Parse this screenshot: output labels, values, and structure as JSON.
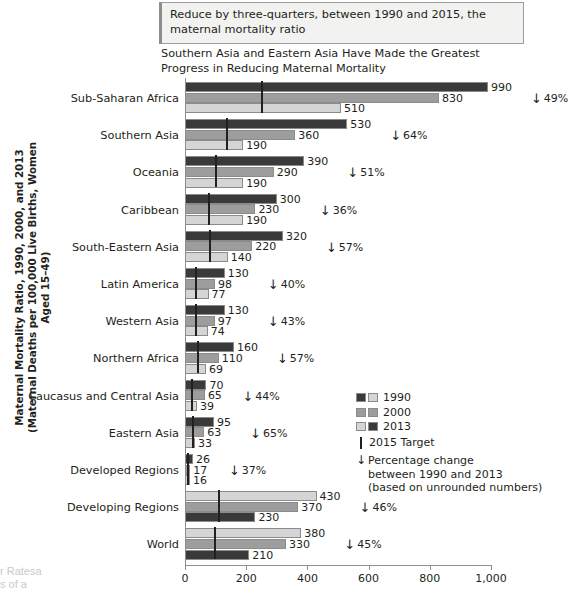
{
  "goal_box": {
    "text": "Reduce by three-quarters, between 1990 and 2015, the maternal mortality ratio"
  },
  "chart_title": "Southern Asia and Eastern Asia Have Made the Greatest Progress in Reducing Maternal Mortality",
  "y_axis_caption": "Maternal Mortality Ratio, 1990, 2000, and 2013 (Maternal Deaths per 100,000 Live Births, Women Aged 15–49)",
  "background_text_1": "r Ratesa",
  "background_text_2": "s of a",
  "legend": {
    "items": [
      {
        "label": "1990"
      },
      {
        "label": "2000"
      },
      {
        "label": "2013"
      }
    ],
    "target_label": "2015 Target",
    "pct_line1": "Percentage change",
    "pct_line2": "between 1990 and 2013",
    "pct_line3": "(based on unrounded numbers)"
  },
  "chart_data": {
    "type": "bar",
    "orientation": "horizontal",
    "title": "Southern Asia and Eastern Asia Have Made the Greatest Progress in Reducing Maternal Mortality",
    "xlabel": "",
    "ylabel": "Maternal Mortality Ratio, 1990, 2000, and 2013 (Maternal Deaths per 100,000 Live Births, Women Aged 15–49)",
    "xlim": [
      0,
      1000
    ],
    "xticks": [
      0,
      200,
      400,
      600,
      800,
      1000
    ],
    "xtick_labels": [
      "0",
      "200",
      "400",
      "600",
      "800",
      "1,000"
    ],
    "grid": false,
    "legend_position": "right-middle",
    "series": [
      {
        "name": "1990",
        "color": "#3a3a3a"
      },
      {
        "name": "2000",
        "color": "#9d9d9d"
      },
      {
        "name": "2013",
        "color": "#d5d5d5"
      }
    ],
    "categories": [
      "Sub-Saharan Africa",
      "Southern Asia",
      "Oceania",
      "Caribbean",
      "South-Eastern Asia",
      "Latin America",
      "Western Asia",
      "Northern Africa",
      "Caucasus and Central Asia",
      "Eastern Asia",
      "Developed Regions",
      "Developing Regions",
      "World"
    ],
    "rows": [
      {
        "label": "Sub-Saharan Africa",
        "v1990": 990,
        "v2000": 830,
        "v2013": 510,
        "target": 248,
        "pct_change": "49%",
        "reversed": false
      },
      {
        "label": "Southern Asia",
        "v1990": 530,
        "v2000": 360,
        "v2013": 190,
        "target": 133,
        "pct_change": "64%",
        "reversed": false
      },
      {
        "label": "Oceania",
        "v1990": 390,
        "v2000": 290,
        "v2013": 190,
        "target": 98,
        "pct_change": "51%",
        "reversed": false
      },
      {
        "label": "Caribbean",
        "v1990": 300,
        "v2000": 230,
        "v2013": 190,
        "target": 75,
        "pct_change": "36%",
        "reversed": false
      },
      {
        "label": "South-Eastern Asia",
        "v1990": 320,
        "v2000": 220,
        "v2013": 140,
        "target": 80,
        "pct_change": "57%",
        "reversed": false
      },
      {
        "label": "Latin America",
        "v1990": 130,
        "v2000": 98,
        "v2013": 77,
        "target": 33,
        "pct_change": "40%",
        "reversed": false
      },
      {
        "label": "Western Asia",
        "v1990": 130,
        "v2000": 97,
        "v2013": 74,
        "target": 33,
        "pct_change": "43%",
        "reversed": false
      },
      {
        "label": "Northern Africa",
        "v1990": 160,
        "v2000": 110,
        "v2013": 69,
        "target": 40,
        "pct_change": "57%",
        "reversed": false
      },
      {
        "label": "Caucasus and Central Asia",
        "v1990": 70,
        "v2000": 65,
        "v2013": 39,
        "target": 18,
        "pct_change": "44%",
        "reversed": false
      },
      {
        "label": "Eastern Asia",
        "v1990": 95,
        "v2000": 63,
        "v2013": 33,
        "target": 24,
        "pct_change": "65%",
        "reversed": false
      },
      {
        "label": "Developed Regions",
        "v1990": 26,
        "v2000": 17,
        "v2013": 16,
        "target": 7,
        "pct_change": "37%",
        "reversed": false
      },
      {
        "label": "Developing Regions",
        "v1990": 430,
        "v2000": 370,
        "v2013": 230,
        "target": 108,
        "pct_change": "46%",
        "reversed": true
      },
      {
        "label": "World",
        "v1990": 380,
        "v2000": 330,
        "v2013": 210,
        "target": 95,
        "pct_change": "45%",
        "reversed": true
      }
    ]
  }
}
